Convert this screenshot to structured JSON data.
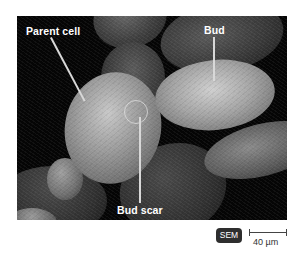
{
  "figure": {
    "type": "scanning electron micrograph",
    "labels": {
      "parent_cell": "Parent cell",
      "bud": "Bud",
      "bud_scar": "Bud scar"
    },
    "imaging_badge": "SEM",
    "scale_bar": {
      "label": "40 µm"
    },
    "colors": {
      "background": "#050505",
      "label_text": "#ffffff",
      "badge_bg": "#2e2e2e",
      "scale_bar": "#444444"
    }
  }
}
